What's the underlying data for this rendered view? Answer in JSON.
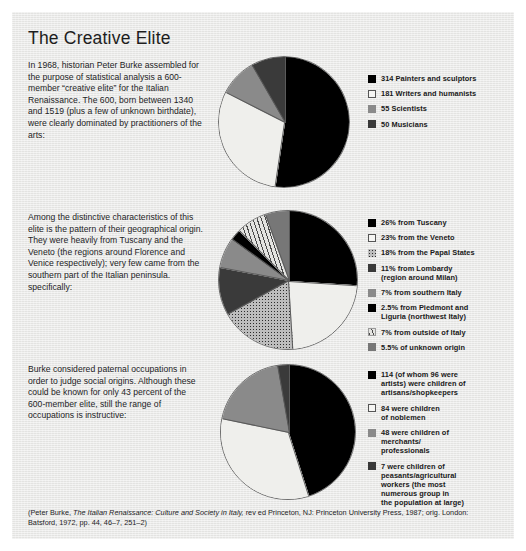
{
  "page": {
    "title": "The Creative Elite",
    "background_color": "#e9e9e7",
    "text_color": "#23231f"
  },
  "sections": [
    {
      "blurb": "In 1968, historian Peter Burke assembled for the purpose of statistical analysis a 600-member “creative elite” for the Italian Renaissance. The 600, born between 1340 and 1519 (plus a few of unknown birthdate), were clearly dominated by practitioners of the arts:",
      "legend": [
        {
          "swatch": "black",
          "label": "314 Painters and sculptors"
        },
        {
          "swatch": "white",
          "label": "181 Writers and humanists"
        },
        {
          "swatch": "gray",
          "label": "55 Scientists"
        },
        {
          "swatch": "dark",
          "label": "50 Musicians"
        }
      ]
    },
    {
      "blurb": "Among the distinctive characteristics of this elite is the pattern of their geographical origin. They were heavily from Tuscany and the Veneto (the regions around Florence and Venice respectively); very few came from the southern part of the Italian peninsula. specifically:",
      "legend": [
        {
          "swatch": "black",
          "label": "26% from Tuscany"
        },
        {
          "swatch": "white",
          "label": "23% from the Veneto"
        },
        {
          "swatch": "dotted",
          "label": "18% from the Papal States"
        },
        {
          "swatch": "dark",
          "label": "11% from Lombardy\n(region around Milan)"
        },
        {
          "swatch": "gray",
          "label": "7% from southern Italy"
        },
        {
          "swatch": "black",
          "label": "2.5% from Piedmont and\nLiguria (northwest Italy)"
        },
        {
          "swatch": "striped",
          "label": "7% from outside of Italy"
        },
        {
          "swatch": "midgray",
          "label": "5.5% of unknown origin"
        }
      ]
    },
    {
      "blurb": "Burke considered paternal occupations in order to judge social origins. Although these could be known for only 43 percent of the 600-member elite, still the range of occupations is instructive:",
      "legend": [
        {
          "swatch": "black",
          "label": "114 (of whom 96 were\nartists) were children of\nartisans/shopkeepers"
        },
        {
          "swatch": "white",
          "label": "84 were children\nof noblemen"
        },
        {
          "swatch": "gray",
          "label": "48 were children of\nmerchants/\nprofessionals"
        },
        {
          "swatch": "dark",
          "label": "7 were children of\npeasants/agricultural\nworkers (the most\nnumerous group in\nthe population at large)"
        }
      ]
    }
  ],
  "chart_data": [
    {
      "type": "pie",
      "title": "Composition of the 600-member creative elite",
      "total": 600,
      "unit": "people",
      "start_angle_deg": 0,
      "direction": "clockwise",
      "categories": [
        "314 Painters and sculptors",
        "181 Writers and humanists",
        "55 Scientists",
        "50 Musicians"
      ],
      "values": [
        314,
        181,
        55,
        50
      ],
      "percents": [
        52.3,
        30.2,
        9.2,
        8.3
      ],
      "fills": [
        "black",
        "white",
        "gray",
        "dark"
      ],
      "legend_position": "right"
    },
    {
      "type": "pie",
      "title": "Geographical origin of the creative elite",
      "total": 100,
      "unit": "percent",
      "start_angle_deg": 0,
      "direction": "clockwise",
      "categories": [
        "26% from Tuscany",
        "23% from the Veneto",
        "18% from the Papal States",
        "11% from Lombardy (region around Milan)",
        "7% from southern Italy",
        "2.5% from Piedmont and Liguria (northwest Italy)",
        "7% from outside of Italy",
        "5.5% of unknown origin"
      ],
      "values": [
        26,
        23,
        18,
        11,
        7,
        2.5,
        7,
        5.5
      ],
      "percents": [
        26,
        23,
        18,
        11,
        7,
        2.5,
        7,
        5.5
      ],
      "fills": [
        "black",
        "white",
        "dotted",
        "dark",
        "gray",
        "black",
        "striped",
        "midgray"
      ],
      "legend_position": "right"
    },
    {
      "type": "pie",
      "title": "Paternal occupations of the creative elite",
      "total": 253,
      "unit": "people",
      "start_angle_deg": 0,
      "direction": "clockwise",
      "categories": [
        "114 (of whom 96 were artists) were children of artisans/shopkeepers",
        "84 were children of noblemen",
        "48 were children of merchants/professionals",
        "7 were children of peasants/agricultural workers (the most numerous group in the population at large)"
      ],
      "values": [
        114,
        84,
        48,
        7
      ],
      "percents": [
        45.1,
        33.2,
        19.0,
        2.8
      ],
      "fills": [
        "black",
        "white",
        "gray",
        "dark"
      ],
      "legend_position": "right"
    }
  ],
  "footer": {
    "part1": "(Peter Burke, ",
    "italic": "The Italian Renaissance: Culture and Society in Italy,",
    "part2": " rev ed Princeton, NJ: Princeton University Press, 1987; orig. London: Batsford, 1972, pp. 44, 46–7, 251–2)"
  }
}
